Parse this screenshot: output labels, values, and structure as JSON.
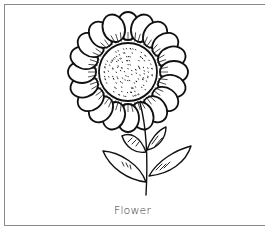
{
  "figure": {
    "caption": "Flower",
    "illustration": "flower-line-drawing",
    "colors": {
      "line": "#111111",
      "frame": "#8a8a8a",
      "background": "#ffffff",
      "caption": "#333333"
    }
  }
}
